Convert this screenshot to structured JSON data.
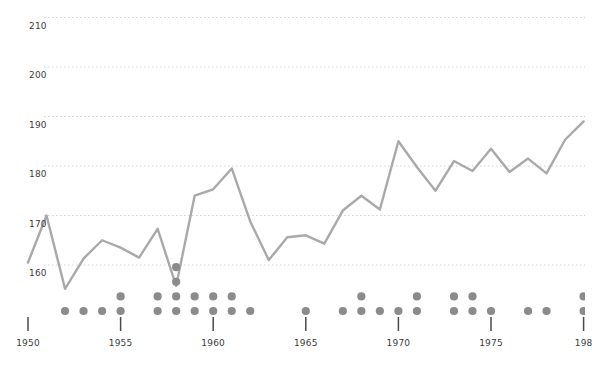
{
  "chart_data": {
    "type": "line",
    "title": "",
    "subtitle": "",
    "xlabel": "",
    "ylabel": "",
    "xlim": [
      1949.5,
      1980.5
    ],
    "ylim": [
      152,
      214
    ],
    "grid": true,
    "grid_style": "dotted-horizontal",
    "legend": "none",
    "y_ticks": [
      210,
      200,
      190,
      180,
      170,
      160
    ],
    "y_tick_labels": [
      "210",
      "200",
      "190",
      "180",
      "170",
      "160"
    ],
    "x_ticks": [
      1950,
      1955,
      1960,
      1965,
      1970,
      1975,
      1980
    ],
    "x_tick_labels": [
      "1950",
      "1955",
      "1960",
      "1965",
      "1970",
      "1975",
      "198"
    ],
    "series": [
      {
        "name": "line-series",
        "type": "line",
        "color": "#a9a9a9",
        "x": [
          1950,
          1951,
          1952,
          1953,
          1954,
          1955,
          1956,
          1957,
          1958,
          1959,
          1960,
          1961,
          1962,
          1963,
          1964,
          1965,
          1966,
          1967,
          1968,
          1969,
          1970,
          1971,
          1972,
          1973,
          1974,
          1975,
          1976,
          1977,
          1978,
          1979,
          1980
        ],
        "values": [
          160.5,
          170.0,
          155.2,
          161.3,
          165.0,
          163.5,
          161.5,
          167.3,
          155.8,
          174.0,
          175.3,
          179.5,
          168.8,
          161.0,
          165.6,
          166.0,
          164.3,
          171.0,
          174.0,
          171.2,
          185.0,
          179.8,
          175.0,
          181.0,
          179.0,
          183.5,
          178.8,
          181.5,
          178.5,
          185.3,
          189.0
        ]
      },
      {
        "name": "dot-plot",
        "type": "scatter-stacked",
        "color": "#8b8b8b",
        "description": "Stacked dot plot along the baseline; each column is a year with a count of dots.",
        "columns": [
          {
            "year": 1952,
            "count": 1
          },
          {
            "year": 1953,
            "count": 1
          },
          {
            "year": 1954,
            "count": 1
          },
          {
            "year": 1955,
            "count": 2
          },
          {
            "year": 1957,
            "count": 2
          },
          {
            "year": 1958,
            "count": 4
          },
          {
            "year": 1959,
            "count": 2
          },
          {
            "year": 1960,
            "count": 2
          },
          {
            "year": 1961,
            "count": 2
          },
          {
            "year": 1962,
            "count": 1
          },
          {
            "year": 1965,
            "count": 1
          },
          {
            "year": 1967,
            "count": 1
          },
          {
            "year": 1968,
            "count": 2
          },
          {
            "year": 1969,
            "count": 1
          },
          {
            "year": 1970,
            "count": 1
          },
          {
            "year": 1971,
            "count": 2
          },
          {
            "year": 1973,
            "count": 2
          },
          {
            "year": 1974,
            "count": 2
          },
          {
            "year": 1975,
            "count": 1
          },
          {
            "year": 1977,
            "count": 1
          },
          {
            "year": 1978,
            "count": 1
          },
          {
            "year": 1980,
            "count": 2
          }
        ]
      }
    ]
  },
  "style": {
    "line_color": "#a9a9a9",
    "dot_color": "#8b8b8b",
    "grid_color": "#d9d2d2",
    "tick_color": "#4a4a4a",
    "label_color": "#3c3c3c",
    "background": "#ffffff"
  }
}
